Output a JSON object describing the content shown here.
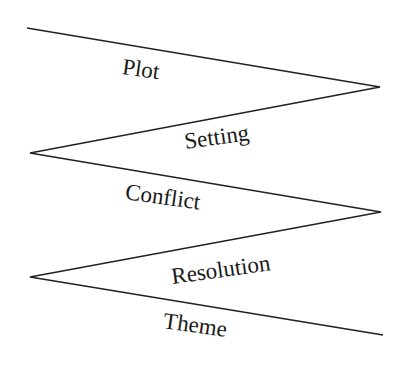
{
  "diagram": {
    "type": "zigzag",
    "line_color": "#222222",
    "labels": [
      {
        "text": "Plot"
      },
      {
        "text": "Setting"
      },
      {
        "text": "Conflict"
      },
      {
        "text": "Resolution"
      },
      {
        "text": "Theme"
      }
    ],
    "segments": [
      {
        "from": [
          27,
          28
        ],
        "to": [
          380,
          87
        ]
      },
      {
        "from": [
          380,
          87
        ],
        "to": [
          30,
          153
        ]
      },
      {
        "from": [
          30,
          153
        ],
        "to": [
          381,
          212
        ]
      },
      {
        "from": [
          381,
          212
        ],
        "to": [
          30,
          277
        ]
      },
      {
        "from": [
          30,
          277
        ],
        "to": [
          383,
          335
        ]
      }
    ]
  }
}
